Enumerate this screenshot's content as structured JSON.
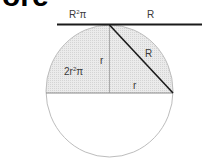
{
  "diagram": {
    "title_fragment": "ore",
    "labels": {
      "top_left": {
        "base": "R",
        "sup": "2",
        "tail": "π"
      },
      "top_right": "R",
      "area_left": {
        "prefix": "2r",
        "sup": "2",
        "tail": "π"
      },
      "vertical_radius": "r",
      "horizontal_radius": "r",
      "diagonal": "R"
    },
    "colors": {
      "line_dark": "#1a1a1a",
      "circle_stroke": "#bdbdbd",
      "fill_shade": "#e6e6e6",
      "inner_line": "#8a8a8a",
      "text": "#3a3a3a"
    }
  }
}
